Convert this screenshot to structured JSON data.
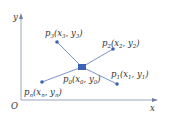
{
  "axes": {
    "x_label": "x",
    "y_label": "y",
    "origin_label": "O",
    "axis_color": "#9aa6bf"
  },
  "center": {
    "label": "p",
    "sub": "0",
    "coords": "(x",
    "coord_sub_x": "0",
    "sep": ", y",
    "coord_sub_y": "0",
    "close": ")",
    "color": "#3b62b8"
  },
  "points": [
    {
      "label": "p",
      "sub": "1",
      "coords": "(x",
      "sx": "1",
      "sep": ", y",
      "sy": "1",
      "close": ")"
    },
    {
      "label": "p",
      "sub": "2",
      "coords": "(x",
      "sx": "2",
      "sep": ", y",
      "sy": "2",
      "close": ")"
    },
    {
      "label": "p",
      "sub": "3",
      "coords": "(x",
      "sx": "3",
      "sep": ", y",
      "sy": "3",
      "close": ")"
    },
    {
      "label": "p",
      "sub": "n",
      "coords": "(x",
      "sx": "n",
      "sep": ", y",
      "sy": "n",
      "close": ")"
    }
  ],
  "colors": {
    "line": "#7d93c8",
    "point": "#3b62b8"
  }
}
